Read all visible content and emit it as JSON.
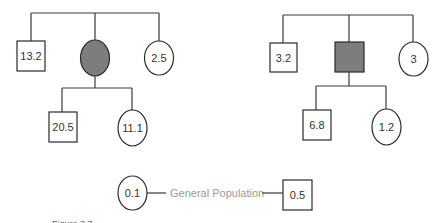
{
  "diagram": {
    "type": "pedigree",
    "colors": {
      "line": "#3a3a3a",
      "affected_fill": "#7d7d7d",
      "unaffected_fill": "#ffffff",
      "legend_text": "#9a9a9a"
    },
    "left_pedigree": {
      "proband": {
        "shape": "circle",
        "sex": "female",
        "affected": true,
        "label": ""
      },
      "siblings": [
        {
          "shape": "square",
          "sex": "male",
          "label": "13.2"
        },
        {
          "shape": "circle",
          "sex": "female",
          "label": "2.5"
        }
      ],
      "children": [
        {
          "shape": "square",
          "sex": "male",
          "label": "20.5"
        },
        {
          "shape": "circle",
          "sex": "female",
          "label": "11.1"
        }
      ]
    },
    "right_pedigree": {
      "proband": {
        "shape": "square",
        "sex": "male",
        "affected": true,
        "label": ""
      },
      "siblings": [
        {
          "shape": "square",
          "sex": "male",
          "label": "3.2"
        },
        {
          "shape": "circle",
          "sex": "female",
          "label": "3"
        }
      ],
      "children": [
        {
          "shape": "square",
          "sex": "male",
          "label": "6.8"
        },
        {
          "shape": "circle",
          "sex": "female",
          "label": "1.2"
        }
      ]
    },
    "general_population": {
      "label": "General Population",
      "female": {
        "shape": "circle",
        "label": "0.1"
      },
      "male": {
        "shape": "square",
        "label": "0.5"
      }
    },
    "caption": "Figure 3.7"
  }
}
